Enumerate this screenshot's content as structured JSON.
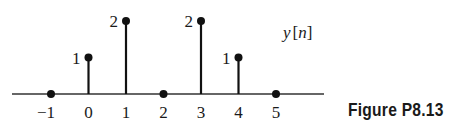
{
  "chart_data": {
    "type": "stem",
    "title": "y[n]",
    "xlabel": "n",
    "ylabel": "y[n]",
    "x": [
      -1,
      0,
      1,
      2,
      3,
      4,
      5
    ],
    "values": [
      0,
      1,
      2,
      0,
      2,
      1,
      0
    ],
    "tick_labels": [
      "−1",
      "0",
      "1",
      "2",
      "3",
      "4",
      "5"
    ],
    "value_labels": [
      "",
      "1",
      "2",
      "",
      "2",
      "1",
      ""
    ],
    "ylim": [
      0,
      2
    ],
    "grid": false,
    "legend": null
  },
  "signal_label": {
    "name": "y",
    "index": "n"
  },
  "caption": "Figure P8.13",
  "colors": {
    "stroke": "#111111",
    "axis": "#333333",
    "text": "#1a1a1a"
  }
}
